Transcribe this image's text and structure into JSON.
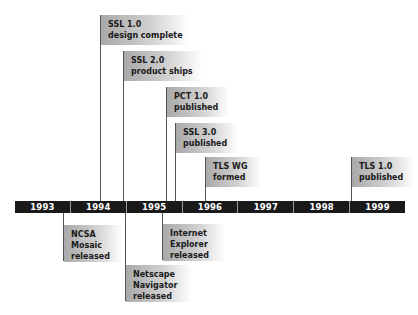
{
  "timeline": {
    "years": [
      "1993",
      "1994",
      "1995",
      "1996",
      "1997",
      "1998",
      "1999"
    ]
  },
  "events_above": [
    {
      "line1": "SSL 1.0",
      "line2": "design complete"
    },
    {
      "line1": "SSL 2.0",
      "line2": "product ships"
    },
    {
      "line1": "PCT 1.0",
      "line2": "published"
    },
    {
      "line1": "SSL 3.0",
      "line2": "published"
    },
    {
      "line1": "TLS WG",
      "line2": "formed"
    },
    {
      "line1": "TLS 1.0",
      "line2": "published"
    }
  ],
  "events_below": [
    {
      "line1": "NCSA",
      "line2": "Mosaic",
      "line3": "released"
    },
    {
      "line1": "Netscape",
      "line2": "Navigator",
      "line3": "released"
    },
    {
      "line1": "Internet",
      "line2": "Explorer",
      "line3": "released"
    }
  ],
  "colors": {
    "bar": "#1a1a1a",
    "label_gradient_start": "#a9a9a9",
    "stem": "#555555"
  }
}
